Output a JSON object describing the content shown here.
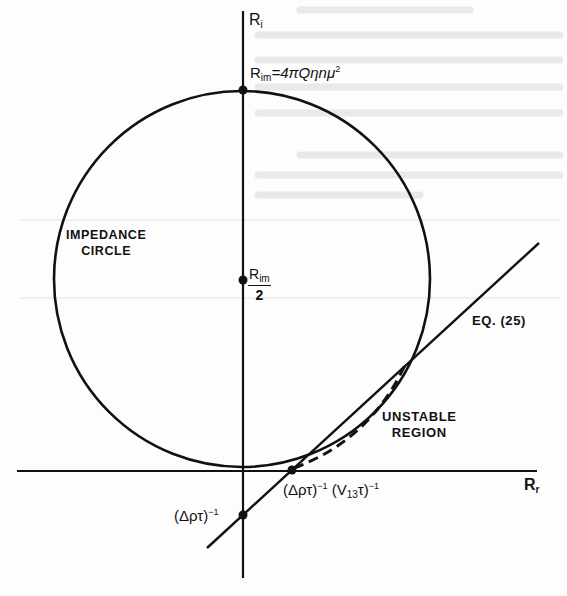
{
  "figure": {
    "type": "impedance-circle-diagram",
    "colors": {
      "ink": "#111111",
      "paper": "#fdfdfd",
      "bleed_through": "#e6e6e6"
    }
  },
  "axes": {
    "vertical": {
      "label_base": "R",
      "label_sub": "i"
    },
    "horizontal": {
      "label_base": "R",
      "label_sub": "r"
    }
  },
  "points": {
    "top": {
      "label_base": "R",
      "label_sub": "im",
      "label_eq": "=4πQηnμ",
      "label_sup": "2"
    },
    "center": {
      "num_base": "R",
      "num_sub": "im",
      "den": "2"
    },
    "y_intercept": {
      "label": "(Δρτ)",
      "label_sup": "−1"
    },
    "x_intercept": {
      "label_a": "(Δρτ)",
      "sup_a": "−1",
      "label_b_open": "(V",
      "label_b_sub": "13",
      "label_b_close": "τ)",
      "sup_b": "−1"
    }
  },
  "annotations": {
    "circle_line1": "IMPEDANCE",
    "circle_line2": "CIRCLE",
    "equation_ref": "EQ. (25)",
    "unstable_line1": "UNSTABLE",
    "unstable_line2": "REGION"
  },
  "geometry": {
    "circle": {
      "cx": 242,
      "cy": 279,
      "r": 188
    },
    "v_axis": {
      "x": 243,
      "y1": 11,
      "y2": 578
    },
    "h_axis": {
      "y": 471,
      "x1": 17,
      "x2": 537
    },
    "line_eq25": {
      "x1": 207,
      "y1": 548,
      "x2": 539,
      "y2": 243
    },
    "dots": [
      {
        "x": 243,
        "y": 90
      },
      {
        "x": 243,
        "y": 280
      },
      {
        "x": 292,
        "y": 470
      },
      {
        "x": 243,
        "y": 515
      }
    ]
  }
}
